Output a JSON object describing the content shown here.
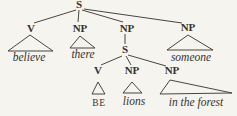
{
  "colors": {
    "ink": "#35322d",
    "background": "#f6f4ef"
  },
  "tree": {
    "root": {
      "label": "S"
    },
    "children": [
      {
        "label": "V",
        "word": "believe"
      },
      {
        "label": "NP",
        "word": "there"
      },
      {
        "label": "NP",
        "child": {
          "label": "S",
          "children": [
            {
              "label": "V",
              "word": "BE"
            },
            {
              "label": "NP",
              "word": "lions"
            },
            {
              "label": "NP",
              "word": "in the forest"
            }
          ]
        }
      },
      {
        "label": "NP",
        "word": "someone"
      }
    ]
  }
}
